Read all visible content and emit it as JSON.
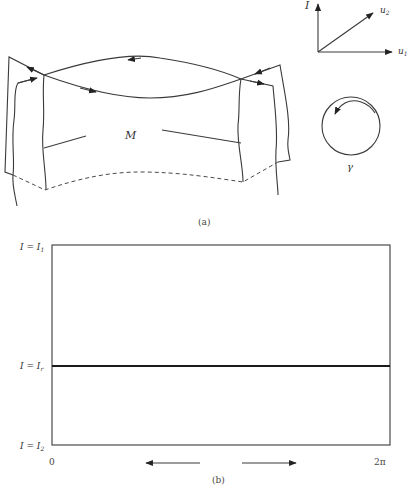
{
  "figure_a": {
    "caption": "(a)",
    "manifold_label": "M",
    "axes": {
      "vertical_label": "I",
      "u1_label": "u",
      "u1_sub": "1",
      "u2_label": "u",
      "u2_sub": "2"
    },
    "circle_label": "γ"
  },
  "figure_b": {
    "caption": "(b)",
    "y_labels": {
      "top": "I = I",
      "top_sub": "1",
      "middle": "I = I",
      "middle_sub": "r",
      "bottom": "I = I",
      "bottom_sub": "2"
    },
    "x_labels": {
      "start": "0",
      "end": "2π"
    }
  },
  "colors": {
    "stroke": "#3a3a3a",
    "background": "#ffffff"
  }
}
